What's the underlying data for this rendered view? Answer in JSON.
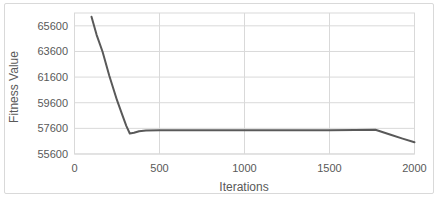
{
  "chart": {
    "colors": {
      "line": "#595959",
      "grid": "#d9d9d9",
      "plot_border": "#d9d9d9",
      "chart_border": "#d9d9d9",
      "text": "#595959",
      "background": "#ffffff"
    }
  },
  "chart_data": {
    "type": "line",
    "title": "",
    "xlabel": "Iterations",
    "ylabel": "Fitness Value",
    "xlim": [
      0,
      2000
    ],
    "ylim": [
      55600,
      66600
    ],
    "x_ticks": [
      0,
      500,
      1000,
      1500,
      2000
    ],
    "y_ticks": [
      55600,
      57600,
      59600,
      61600,
      63600,
      65600
    ],
    "grid": true,
    "legend": false,
    "series": [
      {
        "name": "Fitness Value",
        "points": [
          [
            100,
            66300
          ],
          [
            130,
            64900
          ],
          [
            165,
            63600
          ],
          [
            205,
            61700
          ],
          [
            250,
            59800
          ],
          [
            280,
            58700
          ],
          [
            305,
            57800
          ],
          [
            325,
            57200
          ],
          [
            350,
            57250
          ],
          [
            380,
            57380
          ],
          [
            420,
            57440
          ],
          [
            500,
            57460
          ],
          [
            700,
            57460
          ],
          [
            900,
            57460
          ],
          [
            1100,
            57460
          ],
          [
            1300,
            57460
          ],
          [
            1500,
            57460
          ],
          [
            1650,
            57470
          ],
          [
            1770,
            57490
          ],
          [
            1860,
            57100
          ],
          [
            1930,
            56800
          ],
          [
            2000,
            56520
          ]
        ]
      }
    ]
  }
}
